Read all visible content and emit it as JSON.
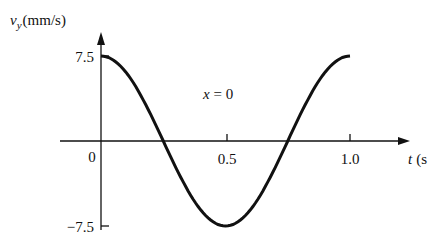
{
  "chart_data": {
    "type": "line",
    "title": "",
    "xlabel": "t (s)",
    "ylabel": "v_y (mm/s)",
    "ylabel_parts": {
      "var": "v",
      "sub": "y",
      "unit": "(mm/s)"
    },
    "xlabel_parts": {
      "var": "t",
      "unit": "(s"
    },
    "annotation": "x = 0",
    "annotation_parts": {
      "var": "x",
      "rest": " = 0"
    },
    "x_ticks": [
      "0",
      "0.5",
      "1.0"
    ],
    "y_ticks": [
      "7.5",
      "-7.5"
    ],
    "y_ticks_display": [
      "7.5",
      "−7.5"
    ],
    "xlim": [
      0,
      1.0
    ],
    "ylim": [
      -7.5,
      7.5
    ],
    "grid": false,
    "series": [
      {
        "name": "v_y at x = 0",
        "function": "7.5*cos(2*pi*t)",
        "x": [
          0,
          0.125,
          0.25,
          0.375,
          0.5,
          0.625,
          0.75,
          0.875,
          1.0
        ],
        "values": [
          7.5,
          5.3,
          0,
          -5.3,
          -7.5,
          -5.3,
          0,
          5.3,
          7.5
        ]
      }
    ]
  }
}
